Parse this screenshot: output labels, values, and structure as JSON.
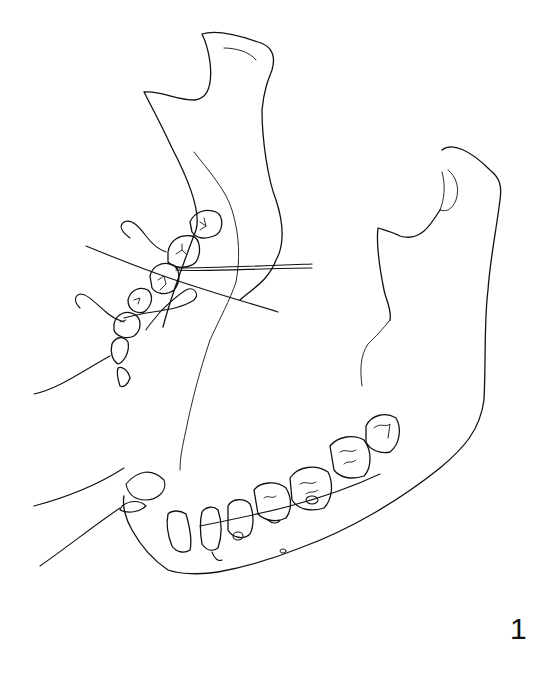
{
  "figure": {
    "label": "1",
    "stroke_color": "#111111",
    "background": "#ffffff"
  }
}
